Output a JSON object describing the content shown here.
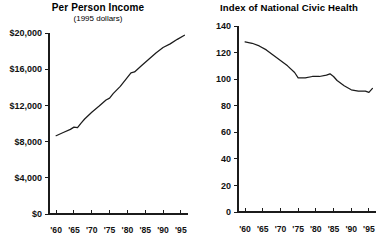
{
  "figure": {
    "background_color": "#ffffff",
    "ink_color": "#1b1b1b",
    "panels": [
      "Per Person Income",
      "Index of National Civic Health"
    ]
  },
  "chart_data": [
    {
      "type": "line",
      "title": "Per Person Income",
      "subtitle": "(1995 dollars)",
      "xlabel": "",
      "ylabel": "",
      "grid": false,
      "legend": "none",
      "xlim": [
        1958,
        1997
      ],
      "ylim": [
        0,
        20000
      ],
      "ytick_labels": [
        "$20,000",
        "$16,000",
        "$12,000",
        "$8,000",
        "$4,000",
        "$0"
      ],
      "ytick_values": [
        20000,
        16000,
        12000,
        8000,
        4000,
        0
      ],
      "xtick_labels": [
        "'60",
        "'65",
        "'70",
        "'75",
        "'80",
        "'85",
        "'90",
        "'95"
      ],
      "xtick_values": [
        1960,
        1965,
        1970,
        1975,
        1980,
        1985,
        1990,
        1995
      ],
      "series": [
        {
          "name": "Per person income (1995 dollars)",
          "x": [
            1960,
            1962,
            1964,
            1965,
            1966,
            1967,
            1968,
            1970,
            1972,
            1974,
            1975,
            1976,
            1978,
            1980,
            1981,
            1982,
            1984,
            1986,
            1988,
            1990,
            1992,
            1994,
            1996
          ],
          "values": [
            8650,
            9000,
            9350,
            9600,
            9550,
            10050,
            10500,
            11250,
            11900,
            12600,
            12800,
            13300,
            14100,
            15100,
            15600,
            15700,
            16400,
            17100,
            17800,
            18400,
            18800,
            19300,
            19750
          ]
        }
      ]
    },
    {
      "type": "line",
      "title": "Index of National Civic Health",
      "subtitle": "",
      "xlabel": "",
      "ylabel": "",
      "grid": false,
      "legend": "none",
      "xlim": [
        1958,
        1997
      ],
      "ylim": [
        0,
        140
      ],
      "ytick_labels": [
        "140",
        "120",
        "100",
        "80",
        "60",
        "40",
        "20",
        "0"
      ],
      "ytick_values": [
        140,
        120,
        100,
        80,
        60,
        40,
        20,
        0
      ],
      "xtick_labels": [
        "'60",
        "'65",
        "'70",
        "'75",
        "'80",
        "'85",
        "'90",
        "'95"
      ],
      "xtick_values": [
        1960,
        1965,
        1970,
        1975,
        1980,
        1985,
        1990,
        1995
      ],
      "series": [
        {
          "name": "Index of National Civic Health",
          "x": [
            1960,
            1962,
            1964,
            1966,
            1968,
            1970,
            1972,
            1974,
            1975,
            1977,
            1979,
            1981,
            1983,
            1984,
            1985,
            1986,
            1988,
            1990,
            1992,
            1994,
            1995,
            1996
          ],
          "values": [
            128,
            127,
            125,
            122,
            118,
            114,
            110,
            105,
            101,
            101,
            102,
            102,
            103,
            104,
            102,
            99,
            95,
            92,
            91,
            91,
            90,
            93
          ]
        }
      ]
    }
  ]
}
